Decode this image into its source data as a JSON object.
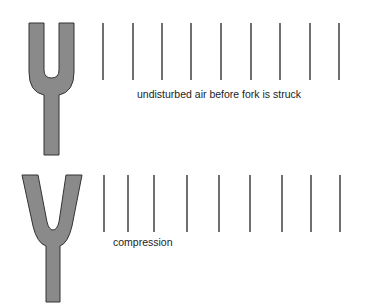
{
  "colors": {
    "fork_fill": "#8a8a8a",
    "fork_stroke": "#333333",
    "line": "#222222"
  },
  "panels": [
    {
      "name": "before-strike",
      "caption": "undisturbed air before fork is struck",
      "fork": "upright tuning fork with parallel prongs",
      "air_lines_x": [
        103,
        133,
        162,
        191,
        221,
        251,
        280,
        310,
        339
      ]
    },
    {
      "name": "compression",
      "caption": "compression",
      "fork": "tuning fork with prongs spread outward",
      "air_lines_x": [
        104,
        128,
        154,
        187,
        219,
        250,
        282,
        311,
        340
      ]
    }
  ]
}
